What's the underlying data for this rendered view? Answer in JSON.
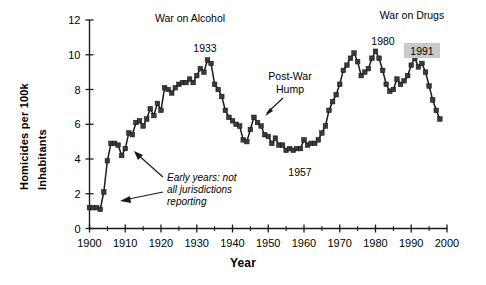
{
  "chart_data": {
    "type": "line",
    "title": "",
    "xlabel": "Year",
    "ylabel": "Homicides per 100k Inhabitants",
    "xlim": [
      1900,
      2000
    ],
    "ylim": [
      0,
      12
    ],
    "xticks": [
      1900,
      1910,
      1920,
      1930,
      1940,
      1950,
      1960,
      1970,
      1980,
      1990,
      2000
    ],
    "xticklabels": [
      "1900",
      "1910",
      "1920",
      "1930",
      "1940",
      "1950",
      "1960",
      "1970",
      "1980",
      "1990",
      "2000"
    ],
    "xminorticks": [
      1905,
      1915,
      1925,
      1935,
      1945,
      1955,
      1965,
      1975,
      1985,
      1995
    ],
    "yticks": [
      0,
      2,
      4,
      6,
      8,
      10,
      12
    ],
    "yticklabels": [
      "0",
      "2",
      "4",
      "6",
      "8",
      "10",
      "12"
    ],
    "grid": false,
    "legend": "none",
    "marker": "square",
    "series": [
      {
        "name": "Homicide rate",
        "x": [
          1900,
          1901,
          1902,
          1903,
          1904,
          1905,
          1906,
          1907,
          1908,
          1909,
          1910,
          1911,
          1912,
          1913,
          1914,
          1915,
          1916,
          1917,
          1918,
          1919,
          1920,
          1921,
          1922,
          1923,
          1924,
          1925,
          1926,
          1927,
          1928,
          1929,
          1930,
          1931,
          1932,
          1933,
          1934,
          1935,
          1936,
          1937,
          1938,
          1939,
          1940,
          1941,
          1942,
          1943,
          1944,
          1945,
          1946,
          1947,
          1948,
          1949,
          1950,
          1951,
          1952,
          1953,
          1954,
          1955,
          1956,
          1957,
          1958,
          1959,
          1960,
          1961,
          1962,
          1963,
          1964,
          1965,
          1966,
          1967,
          1968,
          1969,
          1970,
          1971,
          1972,
          1973,
          1974,
          1975,
          1976,
          1977,
          1978,
          1979,
          1980,
          1981,
          1982,
          1983,
          1984,
          1985,
          1986,
          1987,
          1988,
          1989,
          1990,
          1991,
          1992,
          1993,
          1994,
          1995,
          1996,
          1997,
          1998
        ],
        "y": [
          1.2,
          1.2,
          1.2,
          1.1,
          2.1,
          3.9,
          4.9,
          4.9,
          4.8,
          4.2,
          4.6,
          5.5,
          5.4,
          6.1,
          6.2,
          5.9,
          6.3,
          6.9,
          6.5,
          7.2,
          6.8,
          8.1,
          8.0,
          7.8,
          8.1,
          8.3,
          8.4,
          8.4,
          8.6,
          8.4,
          8.8,
          9.2,
          9.0,
          9.7,
          9.5,
          8.3,
          8.0,
          7.6,
          6.8,
          6.4,
          6.2,
          6.0,
          5.9,
          5.1,
          5.0,
          5.7,
          6.4,
          6.1,
          5.9,
          5.4,
          5.3,
          4.9,
          5.2,
          4.8,
          4.8,
          4.5,
          4.6,
          4.5,
          4.6,
          4.6,
          5.1,
          4.8,
          4.9,
          4.9,
          5.1,
          5.5,
          5.9,
          6.8,
          7.3,
          7.7,
          8.3,
          9.1,
          9.4,
          9.8,
          10.1,
          9.6,
          8.8,
          9.0,
          9.2,
          9.8,
          10.2,
          9.8,
          9.1,
          8.3,
          7.9,
          8.0,
          8.6,
          8.3,
          8.5,
          8.8,
          9.4,
          9.8,
          9.3,
          9.5,
          9.0,
          8.2,
          7.4,
          6.8,
          6.3
        ]
      }
    ],
    "annotations": [
      {
        "name": "war-on-alcohol-label",
        "text": "War on Alcohol"
      },
      {
        "name": "war-on-drugs-label",
        "text": "War on Drugs"
      },
      {
        "name": "peak-1933-label",
        "text": "1933"
      },
      {
        "name": "peak-1980-label",
        "text": "1980"
      },
      {
        "name": "peak-1991-label",
        "text": "1991",
        "highlight": "#c9c9c9"
      },
      {
        "name": "post-war-hump-label",
        "text": "Post-War"
      },
      {
        "name": "post-war-hump-label-2",
        "text": "Hump"
      },
      {
        "name": "trough-1957-label",
        "text": "1957"
      },
      {
        "name": "early-years-note-line1",
        "text": "Early years: not"
      },
      {
        "name": "early-years-note-line2",
        "text": "all jurisdictions"
      },
      {
        "name": "early-years-note-line3",
        "text": "reporting"
      }
    ],
    "colors": {
      "line": "#1a1a1a",
      "marker": "#3a3a3a",
      "axis": "#1a1a1a",
      "highlight": "#c9c9c9",
      "background": "#ffffff"
    }
  }
}
